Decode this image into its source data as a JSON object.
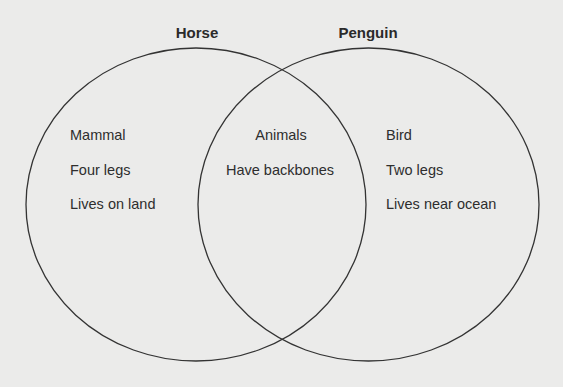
{
  "diagram": {
    "type": "venn",
    "background_color": "#ebebea",
    "stroke_color": "#333333",
    "sets": [
      {
        "title": "Horse",
        "items": [
          "Mammal",
          "Four legs",
          "Lives on land"
        ]
      },
      {
        "title": "Penguin",
        "items": [
          "Bird",
          "Two legs",
          "Lives near ocean"
        ]
      }
    ],
    "intersection": {
      "items": [
        "Animals",
        "Have backbones"
      ]
    }
  }
}
